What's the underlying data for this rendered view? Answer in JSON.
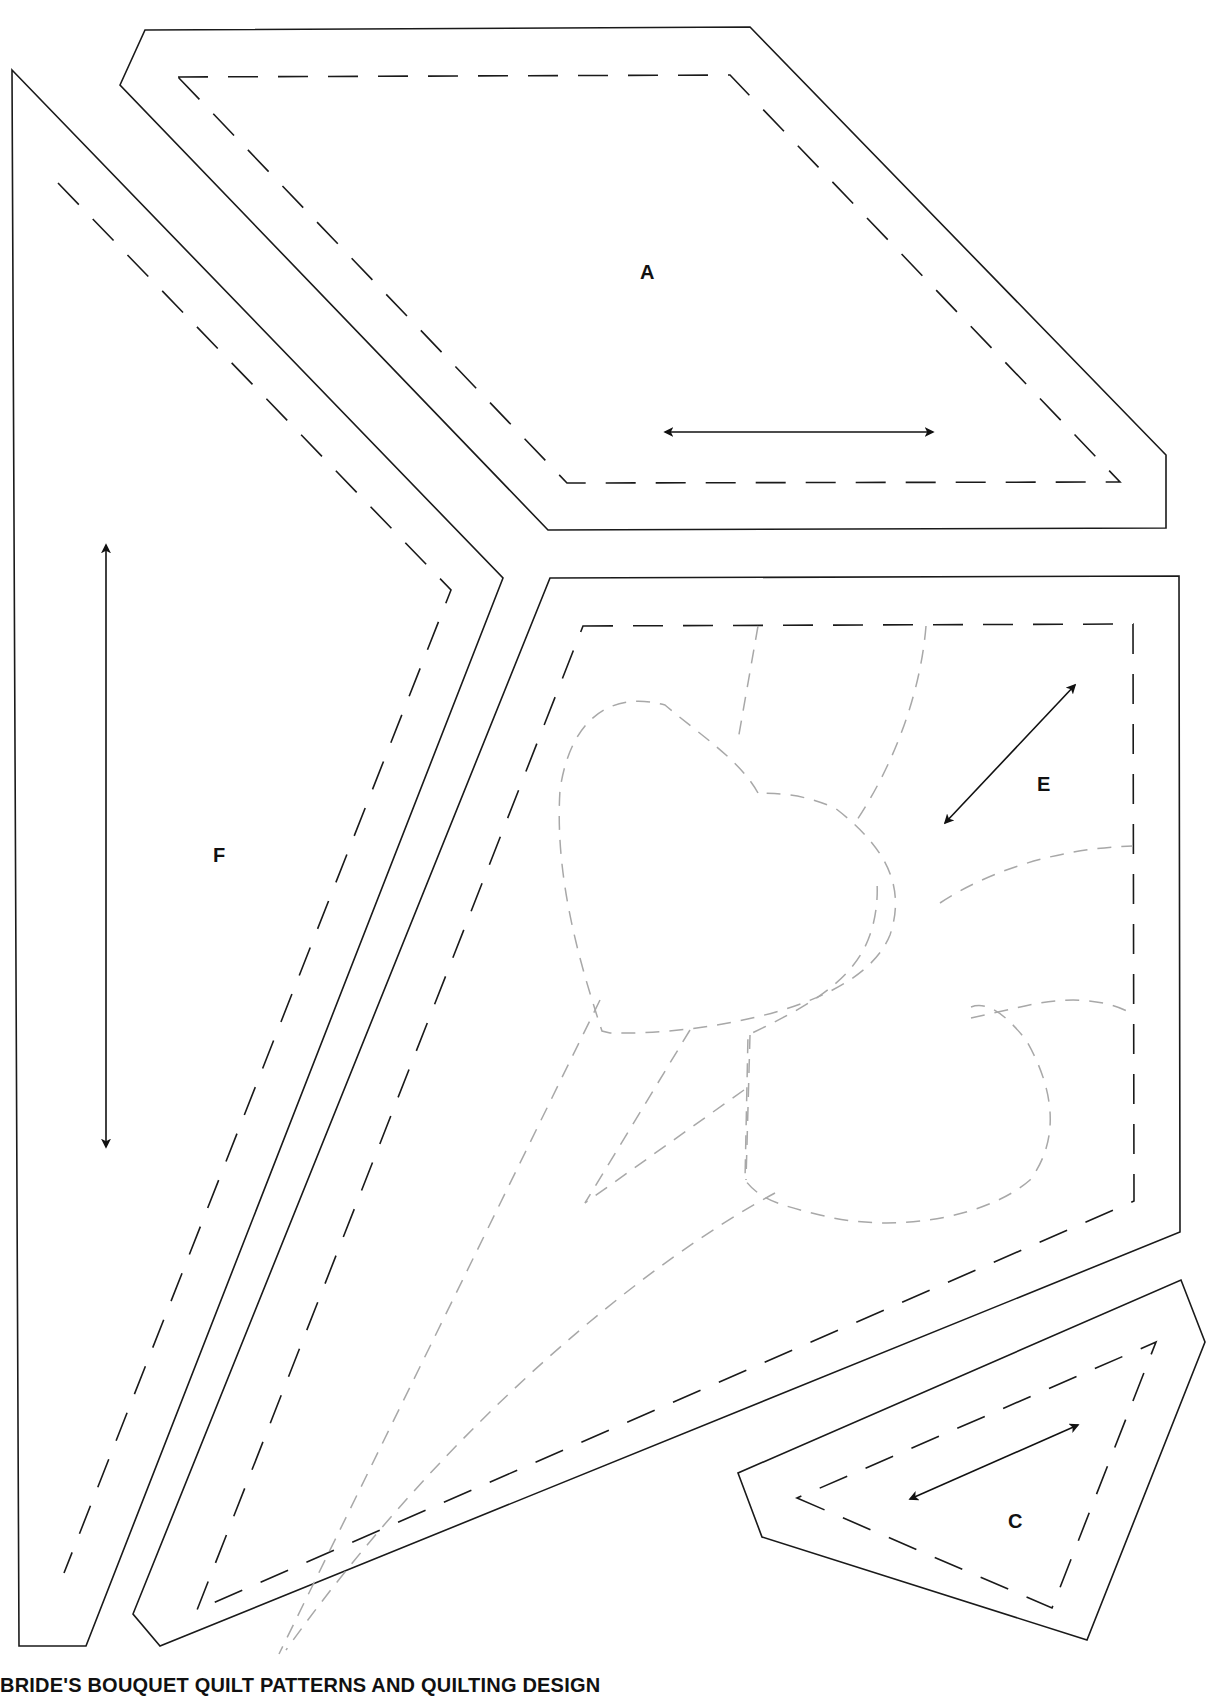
{
  "caption": "BRIDE'S BOUQUET QUILT PATTERNS AND QUILTING DESIGN",
  "colors": {
    "cut_line": "#1a1a1a",
    "seam_line": "#1a1a1a",
    "quilting_line": "#a8a8a8",
    "background": "#ffffff"
  },
  "pieces": {
    "A": {
      "label": "A",
      "label_pos": [
        640,
        262
      ],
      "cut": "145,30 750,27 1166,455 1166,528 548,530 120,85",
      "sew": "178,77 730,75 1120,482 567,483",
      "grain": {
        "from": [
          665,
          432
        ],
        "to": [
          933,
          432
        ]
      }
    },
    "F": {
      "label": "F",
      "label_pos": [
        213,
        845
      ],
      "cut": "12,70 503,578 86,1646 19,1646",
      "sew": "58,183 451,590 64,1573",
      "grain": {
        "from": [
          106,
          545
        ],
        "to": [
          106,
          1147
        ]
      }
    },
    "E": {
      "label": "E",
      "label_pos": [
        1037,
        774
      ],
      "cut": "550,578 1179,576 1180,1232 160,1646 133,1614",
      "sew": "583,626 1133,624 1134,1201 197,1610",
      "grain": {
        "from": [
          1075,
          685
        ],
        "to": [
          945,
          823
        ]
      }
    },
    "C": {
      "label": "C",
      "label_pos": [
        1008,
        1511
      ],
      "cut": "738,1473 762,1537 1087,1640 1205,1342 1181,1280",
      "sew": "797,1498 1052,1608 1156,1342",
      "grain": {
        "from": [
          1078,
          1425
        ],
        "to": [
          910,
          1499
        ]
      }
    }
  },
  "quilting": {
    "heart_upper": "M 758 793 C 740 760 700 735 665 705 C 610 690 570 720 560 790 C 555 870 575 950 602 1031 L 610 1033 C 700 1035 860 1010 890 935 C 905 890 890 850 835 808 C 800 793 780 794 758 793 Z",
    "heart_lower": "M 971 1007 C 990 1000 1010 1020 1026 1040 C 1055 1090 1060 1140 1030 1180 C 990 1215 900 1235 820 1215 C 780 1205 760 1200 745 1180 L 748 1035 C 800 1010 850 985 868 940 C 876 920 878 900 877 882",
    "lines": [
      "M 758 626 L 738 740",
      "M 926 626 C 920 700 890 770 857 820",
      "M 940 903 C 990 870 1060 848 1133 846",
      "M 971 1018 L 1025 1006 C 1060 998 1100 996 1133 1014",
      "M 600 1000 L 279 1654",
      "M 690 1030 L 585 1203",
      "M 750 1035 L 746 1180",
      "M 744 1090 L 585 1203",
      "M 775 1193 C 650 1260 450 1420 286 1650"
    ]
  }
}
